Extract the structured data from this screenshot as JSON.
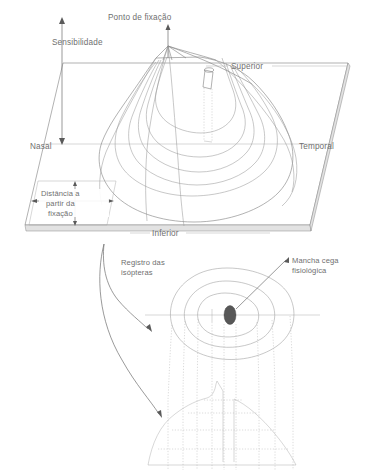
{
  "figure": {
    "background_color": "#ffffff",
    "line_color": "#7d7d7d",
    "text_color": "#6f6f6f",
    "blindspot_color": "#575757"
  },
  "top_diagram": {
    "name": "hill-of-vision-3d",
    "labels": {
      "peak": "Ponto de fixação",
      "vertical_axis": "Sensibilidade",
      "horizontal_axis": "Distância a partir da fixação",
      "horizontal_axis_line1": "Distância a",
      "horizontal_axis_line2": "partir da",
      "horizontal_axis_line3": "fixação",
      "left": "Nasal",
      "right": "Temporal",
      "back": "Superior",
      "front": "Inferior"
    },
    "contour_count": 6
  },
  "bottom_diagram": {
    "name": "isopter-map",
    "labels": {
      "record": "Registro das isópteras",
      "record_line1": "Registro das",
      "record_line2": "isópteras",
      "blindspot": "Mancha cega fisiológica",
      "blindspot_line1": "Mancha cega",
      "blindspot_line2": "fisiológica"
    },
    "isopter_count": 3,
    "has_blind_spot": true,
    "has_fixation_cross": true,
    "has_profile_section": true
  }
}
